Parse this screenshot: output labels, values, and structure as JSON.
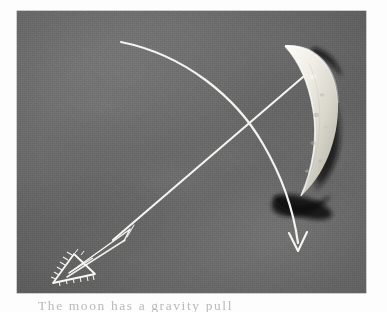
{
  "page": {
    "background_color": "#fdfdfd",
    "width": 387,
    "height": 312
  },
  "photo": {
    "name": "bow-and-arrow-chalk-photograph",
    "frame": {
      "x": 17,
      "y": 11,
      "width": 349,
      "height": 282
    },
    "background_color": "#6b6b6b",
    "background_description": "mottled medium-gray textured surface with film grain",
    "ink_color": "#f2f2ee",
    "shadow_color": "#171717",
    "objects": [
      {
        "name": "crescent-moon-shape",
        "label": "crescent",
        "description": "bright white crescent / bow-limb shape at upper right with dark cast shadow",
        "fill_color": "#e6e4dc",
        "shadow_color": "#141414"
      },
      {
        "name": "straight-arrow-shaft",
        "label": "arrow shaft",
        "description": "long straight double line running from upper right to lower left",
        "stroke_color": "#f4f4f0"
      },
      {
        "name": "triangle-arrowhead",
        "label": "arrowhead",
        "description": "small hatched triangle at lower-left end of the shaft",
        "stroke_color": "#f7f7f3"
      },
      {
        "name": "curved-trajectory-arrow",
        "label": "trajectory",
        "description": "white curved arc sweeping from upper left down to a V arrowhead at lower right",
        "stroke_color": "#f3f3ef"
      }
    ]
  },
  "caption": {
    "name": "figure-caption",
    "clipped": true,
    "line1": "The moon has a gravity pull",
    "note": "text tops only — clipped by image edge"
  }
}
